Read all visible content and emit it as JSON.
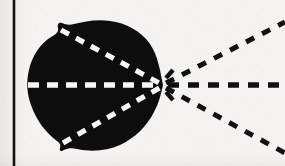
{
  "figure": {
    "type": "scanned-line-figure",
    "caption": "",
    "canvas": {
      "width": 285,
      "height": 166
    },
    "colors": {
      "background": "#f4f3f1",
      "ink": "#111111",
      "blob_fill": "#0d0d0d",
      "dash_light": "#f7f6f4",
      "rule": "#14100f"
    }
  },
  "margin_rule": {
    "name": "left vertical page rule",
    "x": 14,
    "y_top": 0,
    "y_bottom": 166,
    "thickness": 2.6,
    "color": "#14100f"
  },
  "blob": {
    "name": "dark lobed region",
    "fill": "#0d0d0d",
    "bbox": {
      "x": 28,
      "y": 21,
      "width": 136,
      "height": 131
    },
    "vertex": {
      "x": 163,
      "y": 85
    },
    "notches": [
      {
        "name": "upper-left notch",
        "x": 58,
        "y": 26
      },
      {
        "name": "lower-left notch",
        "x": 60,
        "y": 146
      }
    ],
    "outline_path": "M 163 85 C 160 70 158 56 150 44 C 141 31 126 23 110 21 C 96 19 84 22 74 24 C 70 25 66 25 62 23 C 59 22 57 24 58 28 C 59 32 56 34 51 37 C 40 44 32 56 29 70 C 26 82 27 94 31 105 C 36 120 46 133 57 141 C 60 143 61 145 60 148 C 59 151 61 152 64 150 C 68 148 72 148 77 149 C 91 152 107 151 120 145 C 135 138 147 126 154 112 C 159 103 161 94 163 85 Z"
  },
  "rays": {
    "description": "Five dashed rays meeting at the blob vertex: three interior light dashes inside the blob and three dark dashes extending to the right edge.",
    "focal_point": {
      "x": 163,
      "y": 85
    },
    "interior": [
      {
        "name": "interior-upper-dashed-ray",
        "color": "#f7f6f4",
        "from": {
          "x": 61,
          "y": 30
        },
        "to": {
          "x": 161,
          "y": 84
        },
        "dash": "9 8",
        "width": 5.2
      },
      {
        "name": "interior-axis-dashed-ray",
        "color": "#f7f6f4",
        "from": {
          "x": 28,
          "y": 85
        },
        "to": {
          "x": 161,
          "y": 85
        },
        "dash": "11 8",
        "width": 5.4
      },
      {
        "name": "interior-lower-dashed-ray",
        "color": "#f7f6f4",
        "from": {
          "x": 63,
          "y": 143
        },
        "to": {
          "x": 161,
          "y": 87
        },
        "dash": "9 8",
        "width": 5.2
      }
    ],
    "exterior": [
      {
        "name": "exterior-upper-dashed-ray",
        "color": "#111111",
        "from": {
          "x": 166,
          "y": 83
        },
        "to": {
          "x": 285,
          "y": 22
        },
        "dash": "9 9",
        "width": 5.0
      },
      {
        "name": "exterior-axis-dashed-ray",
        "color": "#111111",
        "from": {
          "x": 168,
          "y": 85
        },
        "to": {
          "x": 285,
          "y": 85
        },
        "dash": "11 9",
        "width": 5.4
      },
      {
        "name": "exterior-lower-dashed-ray",
        "color": "#111111",
        "from": {
          "x": 166,
          "y": 88
        },
        "to": {
          "x": 285,
          "y": 153
        },
        "dash": "9 9",
        "width": 5.0
      }
    ],
    "vertex_ticks": [
      {
        "name": "vertex-tick-upper",
        "from": {
          "x": 166,
          "y": 78
        },
        "to": {
          "x": 173,
          "y": 70
        }
      },
      {
        "name": "vertex-tick-lower",
        "from": {
          "x": 166,
          "y": 92
        },
        "to": {
          "x": 173,
          "y": 100
        }
      }
    ]
  },
  "chart_data": {
    "type": "scatter",
    "xlabel": "",
    "ylabel": "",
    "xlim": [
      0,
      285
    ],
    "ylim": [
      166,
      0
    ],
    "grid": false,
    "legend": "none",
    "annotations": [
      "left vertical page rule at x = 14",
      "dark lobed blob spanning x 28-164, y 21-152",
      "five dashed rays converging at focal point (163, 85)",
      "three dark dashed rays diverge right to the image edge"
    ],
    "series": [
      {
        "name": "focal-point",
        "x": [
          163
        ],
        "y": [
          85
        ]
      },
      {
        "name": "exterior-upper-dashed-ray",
        "x": [
          166,
          285
        ],
        "y": [
          83,
          22
        ]
      },
      {
        "name": "exterior-axis-dashed-ray",
        "x": [
          168,
          285
        ],
        "y": [
          85,
          85
        ]
      },
      {
        "name": "exterior-lower-dashed-ray",
        "x": [
          166,
          285
        ],
        "y": [
          88,
          153
        ]
      },
      {
        "name": "interior-upper-dashed-ray",
        "x": [
          61,
          161
        ],
        "y": [
          30,
          84
        ]
      },
      {
        "name": "interior-axis-dashed-ray",
        "x": [
          28,
          161
        ],
        "y": [
          85,
          85
        ]
      },
      {
        "name": "interior-lower-dashed-ray",
        "x": [
          63,
          161
        ],
        "y": [
          143,
          87
        ]
      }
    ]
  }
}
